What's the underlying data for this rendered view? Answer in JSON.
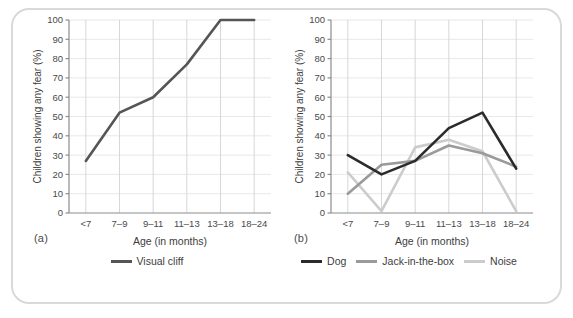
{
  "figure": {
    "background": "#ffffff",
    "frame_color": "#d9d9d9"
  },
  "panels": [
    {
      "key": "a",
      "panel_label": "(a)",
      "legend": [
        {
          "label": "Visual cliff",
          "color": "#555555"
        }
      ]
    },
    {
      "key": "b",
      "panel_label": "(b)",
      "legend": [
        {
          "label": "Dog",
          "color": "#2b2b2b"
        },
        {
          "label": "Jack-in-the-box",
          "color": "#9a9a9a"
        },
        {
          "label": "Noise",
          "color": "#cccccc"
        }
      ]
    }
  ],
  "chart_data": [
    {
      "type": "line",
      "panel": "(a)",
      "title": "",
      "xlabel": "Age (in months)",
      "ylabel": "Children showing any fear (%)",
      "categories": [
        "<7",
        "7–9",
        "9–11",
        "11–13",
        "13–18",
        "18–24"
      ],
      "ylim": [
        0,
        100
      ],
      "yticks": [
        0,
        10,
        20,
        30,
        40,
        50,
        60,
        70,
        80,
        90,
        100
      ],
      "ytick_labels": [
        "0",
        "10",
        "20",
        "30",
        "40",
        "50",
        "60",
        "70",
        "80",
        "90",
        "100"
      ],
      "grid": "both-faint",
      "legend_position": "below",
      "series": [
        {
          "name": "Visual cliff",
          "color": "#555555",
          "values": [
            27,
            52,
            60,
            77,
            100,
            100
          ]
        }
      ]
    },
    {
      "type": "line",
      "panel": "(b)",
      "title": "",
      "xlabel": "Age (in months)",
      "ylabel": "Children showing any fear (%)",
      "categories": [
        "<7",
        "7–9",
        "9–11",
        "11–13",
        "13–18",
        "18–24"
      ],
      "ylim": [
        0,
        100
      ],
      "yticks": [
        0,
        10,
        20,
        30,
        40,
        50,
        60,
        70,
        80,
        90,
        100
      ],
      "ytick_labels": [
        "0",
        "10",
        "20",
        "30",
        "40",
        "50",
        "60",
        "70",
        "80",
        "90",
        "100"
      ],
      "grid": "both-faint",
      "legend_position": "below",
      "series": [
        {
          "name": "Dog",
          "color": "#2b2b2b",
          "values": [
            30,
            20,
            27,
            44,
            52,
            23
          ]
        },
        {
          "name": "Jack-in-the-box",
          "color": "#9a9a9a",
          "values": [
            10,
            25,
            27,
            35,
            31,
            24
          ]
        },
        {
          "name": "Noise",
          "color": "#cccccc",
          "values": [
            21,
            1,
            34,
            38,
            32,
            1
          ]
        }
      ]
    }
  ]
}
